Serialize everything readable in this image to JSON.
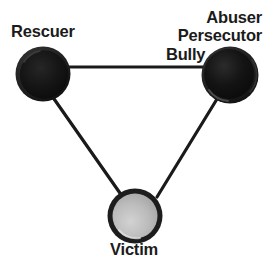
{
  "diagram": {
    "background_color": "#ffffff",
    "line_color": "#1a1a1a",
    "nodes": [
      {
        "id": "rescuer",
        "labels": [
          "Rescuer"
        ],
        "fill": "#141414",
        "ring": "#2a2a2a",
        "cx": 43,
        "cy": 74,
        "r": 27
      },
      {
        "id": "abuser",
        "labels": [
          "Abuser",
          "Persecutor",
          "Bully"
        ],
        "fill": "#131313",
        "ring": "#2b2b2b",
        "cx": 230,
        "cy": 75,
        "r": 28
      },
      {
        "id": "victim",
        "labels": [
          "Victim"
        ],
        "fill": "#b9b9b9",
        "ring": "#1d1d1d",
        "cx": 135,
        "cy": 216,
        "r": 27
      }
    ],
    "edges": [
      {
        "id": "rescuer-abuser",
        "from": "rescuer",
        "to": "abuser"
      },
      {
        "id": "rescuer-victim",
        "from": "rescuer",
        "to": "victim"
      },
      {
        "id": "abuser-victim",
        "from": "abuser",
        "to": "victim"
      }
    ]
  },
  "labels": {
    "rescuer": "Rescuer",
    "abuser": "Abuser",
    "persecutor": "Persecutor",
    "bully": "Bully",
    "victim": "Victim"
  }
}
